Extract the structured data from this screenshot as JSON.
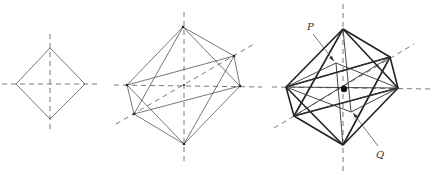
{
  "figure": {
    "panels": [
      {
        "id": "square-projection",
        "label": ""
      },
      {
        "id": "octahedron-wireframe",
        "label": ""
      },
      {
        "id": "octahedron-with-inner-figure",
        "label": ""
      }
    ],
    "labels": {
      "p": "P",
      "q": "Q"
    }
  }
}
